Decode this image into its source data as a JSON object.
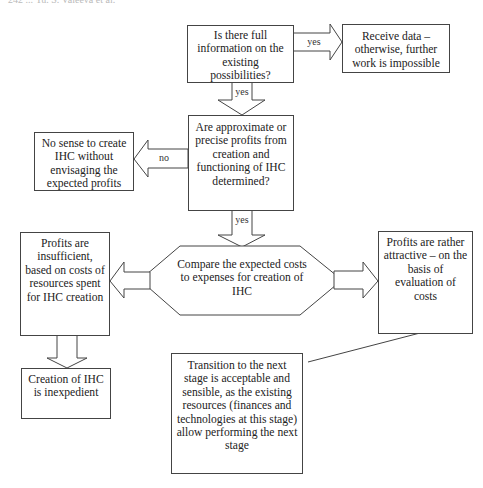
{
  "header": {
    "text": "242 ... Yu. S. Valeeva et al."
  },
  "nodes": {
    "q_full_info": "Is there full information on the existing possibilities?",
    "receive_data": "Receive data – otherwise, further work is impossible",
    "q_profits_determined": "Are approximate or precise profits from creation and functioning of IHC determined?",
    "no_sense": "No sense to create IHC without envisaging the expected profits",
    "compare_costs": "Compare the expected costs to expenses for creation of IHC",
    "profits_insufficient": "Profits are insufficient, based on costs of resources spent for IHC creation",
    "creation_inexpedient": "Creation of IHC is inexpedient",
    "profits_attractive": "Profits are rather attractive – on the basis of evaluation of costs",
    "transition_next_stage": "Transition to the next stage is acceptable and sensible, as the existing resources (finances and technologies at this stage) allow performing the next stage"
  },
  "edges": {
    "full_info_to_receive": "yes",
    "full_info_to_profits": "yes",
    "profits_to_no_sense": "no",
    "profits_to_compare": "yes"
  },
  "colors": {
    "stroke": "#444444",
    "fill": "#ffffff",
    "text": "#222222"
  }
}
